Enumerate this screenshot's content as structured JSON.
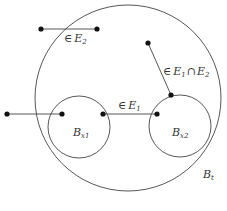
{
  "diagram": {
    "stroke_color": "#444444",
    "dot_color": "#111111",
    "regions": {
      "outer": {
        "label": "B",
        "sub": "t"
      },
      "left": {
        "label": "B",
        "sub": "x1"
      },
      "right": {
        "label": "B",
        "sub": "x2"
      }
    },
    "segments": {
      "top": {
        "prefix": "∈",
        "set": "E",
        "sub": "2"
      },
      "middle": {
        "prefix": "∈",
        "set": "E",
        "sub": "1"
      },
      "right": {
        "prefix": "∈",
        "set1": "E",
        "sub1": "1",
        "op": "∩",
        "set2": "E",
        "sub2": "2"
      }
    },
    "caption": ""
  }
}
